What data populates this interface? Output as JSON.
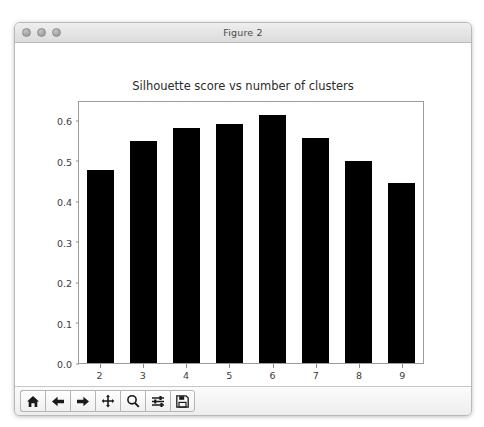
{
  "window": {
    "title": "Figure 2",
    "traffic_lights": [
      "close",
      "minimize",
      "zoom"
    ]
  },
  "chart_data": {
    "type": "bar",
    "title": "Silhouette score vs number of clusters",
    "xlabel": "",
    "ylabel": "",
    "categories": [
      "2",
      "3",
      "4",
      "5",
      "6",
      "7",
      "8",
      "9"
    ],
    "values": [
      0.478,
      0.548,
      0.58,
      0.59,
      0.612,
      0.556,
      0.498,
      0.445
    ],
    "ylim": [
      0.0,
      0.645
    ],
    "yticks": [
      "0.0",
      "0.1",
      "0.2",
      "0.3",
      "0.4",
      "0.5",
      "0.6"
    ],
    "ytick_values": [
      0.0,
      0.1,
      0.2,
      0.3,
      0.4,
      0.5,
      0.6
    ],
    "xticks": [
      "2",
      "3",
      "4",
      "5",
      "6",
      "7",
      "8",
      "9"
    ],
    "grid": false,
    "legend": false,
    "bar_color": "#000000"
  },
  "toolbar": {
    "buttons": [
      {
        "name": "home-icon",
        "label": "Home"
      },
      {
        "name": "back-arrow-icon",
        "label": "Back"
      },
      {
        "name": "forward-arrow-icon",
        "label": "Forward"
      },
      {
        "name": "pan-move-icon",
        "label": "Pan"
      },
      {
        "name": "magnifier-icon",
        "label": "Zoom"
      },
      {
        "name": "sliders-icon",
        "label": "Configure subplots"
      },
      {
        "name": "floppy-disk-icon",
        "label": "Save"
      }
    ]
  }
}
